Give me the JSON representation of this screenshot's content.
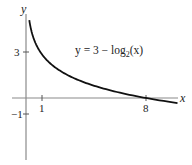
{
  "chart_data": {
    "type": "line",
    "title": "",
    "function": "y = 3 - log2(x)",
    "xlabel": "x",
    "ylabel": "y",
    "x_ticks": [
      {
        "value": 1,
        "label": "1"
      },
      {
        "value": 8,
        "label": "8"
      }
    ],
    "y_ticks": [
      {
        "value": 3,
        "label": "3"
      },
      {
        "value": -1,
        "label": "-1"
      }
    ],
    "xlim": [
      -1.7,
      10.5
    ],
    "ylim": [
      -4.4,
      5.3
    ],
    "grid": false,
    "legend": "none",
    "series": [
      {
        "name": "y = 3 - log2(x)",
        "x": [
          0.22,
          0.3,
          0.5,
          1,
          2,
          3,
          4,
          6,
          8,
          10.1
        ],
        "y": [
          5.18,
          4.74,
          4,
          3,
          2,
          1.42,
          1,
          0.42,
          0,
          -0.34
        ]
      }
    ],
    "annotation": {
      "base": "y = 3 − log",
      "sub": "2",
      "tail": "(x)"
    }
  },
  "labels": {
    "x_axis": "x",
    "y_axis": "y",
    "tick_1": "1",
    "tick_8": "8",
    "tick_3": "3",
    "tick_neg1": "−1"
  },
  "colors": {
    "axis": "#888888",
    "curve": "#111111",
    "text": "#222222"
  }
}
